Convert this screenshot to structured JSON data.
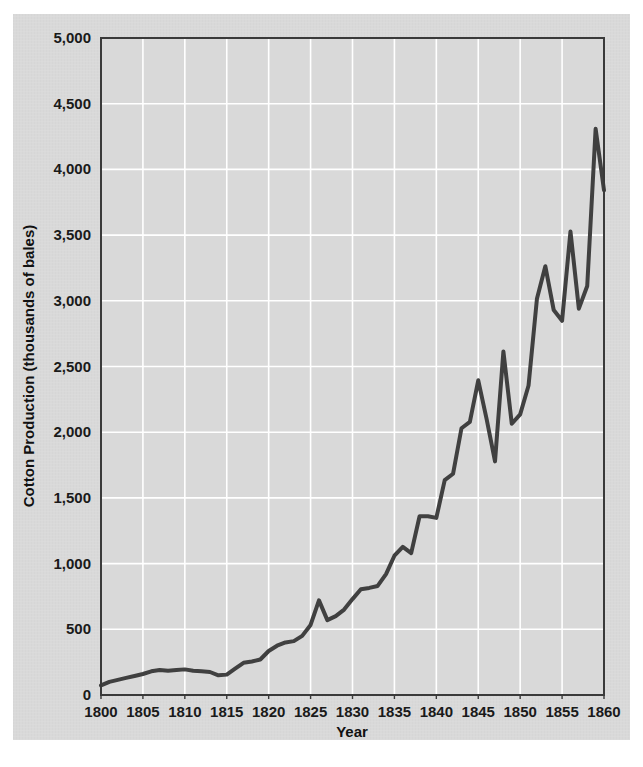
{
  "figure": {
    "background_color": "#d9d9d9",
    "page_color": "#ffffff",
    "plot_border_color": "#3a3a3a",
    "gridline_color": "#ffffff",
    "line_color": "#404040"
  },
  "chart_data": {
    "type": "line",
    "title": "",
    "xlabel": "Year",
    "ylabel": "Cotton Production (thousands of bales)",
    "xlim": [
      1800,
      1860
    ],
    "ylim": [
      0,
      5000
    ],
    "grid": true,
    "legend": "none",
    "xticks": [
      1800,
      1805,
      1810,
      1815,
      1820,
      1825,
      1830,
      1835,
      1840,
      1845,
      1850,
      1855,
      1860
    ],
    "xtick_labels": [
      "1800",
      "1805",
      "1810",
      "1815",
      "1820",
      "1825",
      "1830",
      "1835",
      "1840",
      "1845",
      "1850",
      "1855",
      "1860"
    ],
    "yticks": [
      0,
      500,
      1000,
      1500,
      2000,
      2500,
      3000,
      3500,
      4000,
      4500,
      5000
    ],
    "ytick_labels": [
      "0",
      "500",
      "1,000",
      "1,500",
      "2,000",
      "2,500",
      "3,000",
      "3,500",
      "4,000",
      "4,500",
      "5,000"
    ],
    "series": [
      {
        "name": "Cotton Production",
        "x": [
          1800,
          1801,
          1802,
          1803,
          1804,
          1805,
          1806,
          1807,
          1808,
          1809,
          1810,
          1811,
          1812,
          1813,
          1814,
          1815,
          1816,
          1817,
          1818,
          1819,
          1820,
          1821,
          1822,
          1823,
          1824,
          1825,
          1826,
          1827,
          1828,
          1829,
          1830,
          1831,
          1832,
          1833,
          1834,
          1835,
          1836,
          1837,
          1838,
          1839,
          1840,
          1841,
          1842,
          1843,
          1844,
          1845,
          1846,
          1847,
          1848,
          1849,
          1850,
          1851,
          1852,
          1853,
          1854,
          1855,
          1856,
          1857,
          1858,
          1859,
          1860
        ],
        "y": [
          73,
          100,
          115,
          130,
          145,
          160,
          180,
          190,
          185,
          190,
          195,
          185,
          180,
          175,
          150,
          155,
          200,
          245,
          255,
          270,
          335,
          375,
          400,
          410,
          450,
          533,
          720,
          570,
          600,
          650,
          730,
          805,
          815,
          830,
          920,
          1060,
          1128,
          1080,
          1360,
          1360,
          1348,
          1635,
          1684,
          2030,
          2078,
          2395,
          2100,
          1778,
          2615,
          2064,
          2136,
          2355,
          3015,
          3263,
          2930,
          2848,
          3528,
          2940,
          3113,
          4309,
          3841
        ],
        "peak_year": 1859,
        "peak_value": 4309,
        "final_year": 1860,
        "final_value": 3841
      }
    ]
  },
  "axes": {
    "x_axis_label": "Year",
    "y_axis_label": "Cotton Production (thousands of bales)"
  }
}
